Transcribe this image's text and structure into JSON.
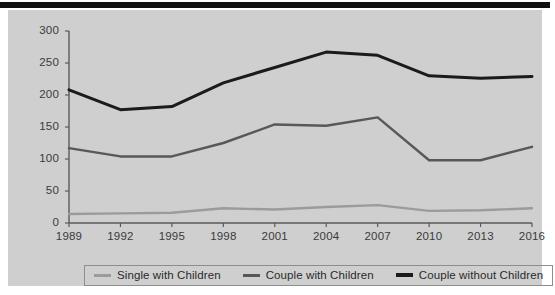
{
  "figure": {
    "background_color": "#cfcfcf",
    "top_bar_color": "#111111",
    "axis_color": "#5a5a5a",
    "text_color": "#3a3a3a"
  },
  "legend": {
    "position": "bottom-center",
    "border_color": "#8d8d8d",
    "items": [
      {
        "label": "Single with Children",
        "color": "#9b9b9b"
      },
      {
        "label": "Couple with Children",
        "color": "#585858"
      },
      {
        "label": "Couple without Children",
        "color": "#1b1b1b"
      }
    ]
  },
  "chart_data": {
    "type": "line",
    "title": "",
    "subtitle": "",
    "xlabel": "",
    "ylabel": "",
    "grid": false,
    "legend_position": "bottom-center",
    "categories": [
      "1989",
      "1992",
      "1995",
      "1998",
      "2001",
      "2004",
      "2007",
      "2010",
      "2013",
      "2016"
    ],
    "x": [
      1989,
      1992,
      1995,
      1998,
      2001,
      2004,
      2007,
      2010,
      2013,
      2016
    ],
    "xlim": [
      1989,
      2016
    ],
    "ylim": [
      0,
      300
    ],
    "yticks": [
      0,
      50,
      100,
      150,
      200,
      250,
      300
    ],
    "ytick_labels": [
      "0",
      "50",
      "100",
      "150",
      "200",
      "250",
      "300"
    ],
    "xtick_labels": [
      "1989",
      "1992",
      "1995",
      "1998",
      "2001",
      "2004",
      "2007",
      "2010",
      "2013",
      "2016"
    ],
    "series": [
      {
        "name": "Single with Children",
        "color": "#9b9b9b",
        "values": [
          14,
          15,
          16,
          23,
          21,
          25,
          28,
          19,
          20,
          23
        ]
      },
      {
        "name": "Couple with Children",
        "color": "#585858",
        "values": [
          117,
          104,
          104,
          125,
          154,
          152,
          165,
          98,
          98,
          119
        ]
      },
      {
        "name": "Couple without Children",
        "color": "#1b1b1b",
        "values": [
          208,
          177,
          182,
          219,
          243,
          267,
          262,
          230,
          226,
          229
        ]
      }
    ]
  }
}
